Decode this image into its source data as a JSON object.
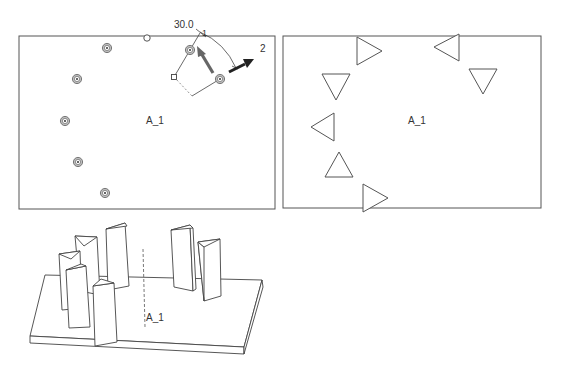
{
  "top_view": {
    "axis_label": "A_1",
    "angle_label": "30.0",
    "callout_1": "1",
    "callout_2": "2",
    "holes": [
      {
        "x": 107,
        "y": 48
      },
      {
        "x": 77,
        "y": 79
      },
      {
        "x": 65,
        "y": 121
      },
      {
        "x": 78,
        "y": 162
      },
      {
        "x": 105,
        "y": 193
      },
      {
        "x": 190,
        "y": 50
      },
      {
        "x": 220,
        "y": 79
      }
    ]
  },
  "pattern_view": {
    "axis_label": "A_1",
    "triangles": [
      "right",
      "left",
      "down",
      "down",
      "left",
      "up",
      "right"
    ]
  },
  "iso_view": {
    "axis_label": "A_1"
  },
  "colors": {
    "line": "#555555",
    "hole_fill": "#bdbdbd",
    "arrow_dark": "#222222",
    "arrow_gray": "#666666"
  }
}
